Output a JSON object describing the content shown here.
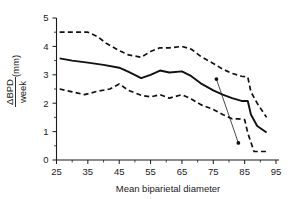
{
  "chart_data": {
    "type": "line",
    "title": "",
    "xlabel": "Mean biparietal diameter",
    "ylabel": "ΔBPD/week (mm)",
    "ylabel_numerator": "ΔBPD",
    "ylabel_denominator": "week",
    "ylabel_units": "(mm)",
    "xlim": [
      25,
      95
    ],
    "ylim": [
      0,
      5
    ],
    "xticks": [
      25,
      35,
      45,
      55,
      65,
      75,
      85,
      95
    ],
    "xtick_labels": [
      "25",
      "35",
      "45",
      "55",
      "65",
      "75",
      "85",
      "95"
    ],
    "xminor_step": 5,
    "yticks": [
      0,
      1,
      2,
      3,
      4,
      5
    ],
    "ytick_labels": [
      "0",
      "1",
      "2",
      "3",
      "4",
      "5"
    ],
    "yminor_step": 0.5,
    "grid": false,
    "legend": "none",
    "series": [
      {
        "name": "Upper limit (95th centile)",
        "style": "dashed",
        "color": "#111111",
        "x": [
          26,
          30,
          35,
          38,
          41,
          45,
          48,
          52,
          55,
          58,
          61,
          65,
          68,
          71,
          75,
          78,
          81,
          84,
          86,
          87,
          89,
          92
        ],
        "values": [
          4.5,
          4.5,
          4.5,
          4.35,
          4.1,
          3.85,
          3.7,
          3.62,
          3.82,
          3.95,
          3.95,
          4.0,
          3.9,
          3.65,
          3.4,
          3.2,
          3.05,
          2.95,
          2.92,
          2.4,
          2.0,
          1.5
        ]
      },
      {
        "name": "Mean",
        "style": "solid",
        "color": "#111111",
        "x": [
          26,
          30,
          35,
          40,
          45,
          48,
          52,
          55,
          58,
          61,
          65,
          68,
          71,
          75,
          78,
          81,
          84,
          86,
          87,
          89,
          92
        ],
        "values": [
          3.58,
          3.5,
          3.43,
          3.35,
          3.25,
          3.1,
          2.88,
          3.0,
          3.15,
          3.08,
          3.12,
          2.95,
          2.7,
          2.45,
          2.3,
          2.18,
          2.08,
          2.08,
          1.6,
          1.2,
          0.97
        ]
      },
      {
        "name": "Lower limit (5th centile)",
        "style": "dashed",
        "color": "#111111",
        "x": [
          26,
          30,
          34,
          38,
          42,
          45,
          48,
          52,
          55,
          58,
          61,
          65,
          68,
          71,
          75,
          78,
          81,
          83,
          85,
          86,
          88,
          92
        ],
        "values": [
          2.5,
          2.4,
          2.3,
          2.42,
          2.5,
          2.68,
          2.45,
          2.28,
          2.22,
          2.3,
          2.18,
          2.3,
          2.15,
          1.95,
          1.78,
          1.6,
          1.45,
          1.45,
          1.42,
          0.95,
          0.3,
          0.3
        ]
      }
    ],
    "annotations": [
      {
        "name": "reference-segment",
        "type": "line-with-endpoints",
        "x1": 76,
        "y1": 2.85,
        "x2": 83,
        "y2": 0.6,
        "marker": "filled-circle",
        "color": "#111111"
      }
    ]
  }
}
